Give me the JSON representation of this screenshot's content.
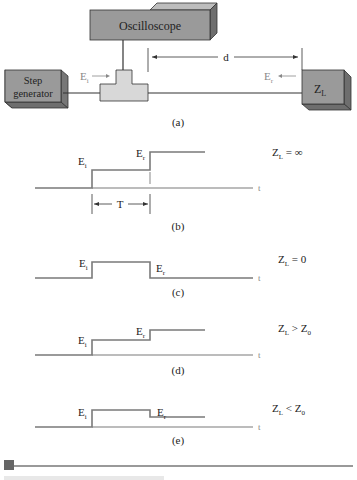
{
  "diagram_a": {
    "oscilloscope_label": "Oscilloscope",
    "generator_label_line1": "Step",
    "generator_label_line2": "generator",
    "load_label": "Z",
    "load_sub": "L",
    "incident_label": "E",
    "incident_sub": "i",
    "reflected_label": "E",
    "reflected_sub": "r",
    "distance_label": "d",
    "caption": "(a)"
  },
  "panels": [
    {
      "id": "b",
      "caption": "(b)",
      "condition": "Z_L = ∞",
      "cond_main": "Z",
      "cond_sub": "L",
      "cond_rest": " = ∞",
      "ei": "E",
      "ei_sub": "i",
      "er": "E",
      "er_sub": "r",
      "time_label": "t",
      "period_label": "T"
    },
    {
      "id": "c",
      "caption": "(c)",
      "condition": "Z_L = 0",
      "cond_main": "Z",
      "cond_sub": "L",
      "cond_rest": " = 0",
      "ei": "E",
      "ei_sub": "i",
      "er": "E",
      "er_sub": "r",
      "time_label": "t"
    },
    {
      "id": "d",
      "caption": "(d)",
      "condition": "Z_L > Z_0",
      "cond_main": "Z",
      "cond_sub": "L",
      "cond_rest": " > Z",
      "cond_sub2": "0",
      "ei": "E",
      "ei_sub": "i",
      "er": "E",
      "er_sub": "r",
      "time_label": "t"
    },
    {
      "id": "e",
      "caption": "(e)",
      "condition": "Z_L < Z_0",
      "cond_main": "Z",
      "cond_sub": "L",
      "cond_rest": " < Z",
      "cond_sub2": "0",
      "ei": "E",
      "ei_sub": "i",
      "er": "E",
      "er_sub": "r",
      "time_label": "t"
    }
  ],
  "colors": {
    "box_fill": "#9a9a9a",
    "box_side": "#6e6e6e",
    "tee_fill": "#d8d8d8",
    "wave": "#7a7a7a",
    "line": "#333333",
    "grey_text": "#8a8a8a",
    "footer_marker": "#666666"
  }
}
